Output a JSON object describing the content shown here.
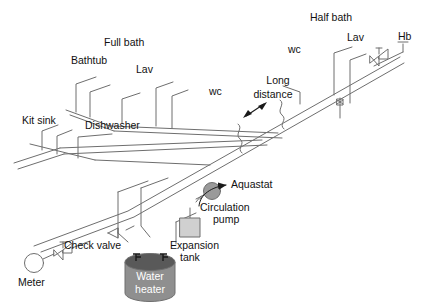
{
  "diagram": {
    "type": "piping-isometric",
    "colors": {
      "line": "#6e6e6e",
      "line_dark": "#3a3a3a",
      "text": "#111111",
      "pump_fill": "#9a9a9a",
      "heater_body": "#8f8f8f",
      "heater_top": "#595959",
      "tank_fill": "#d0d0d0",
      "background": "#ffffff"
    },
    "labels": {
      "full_bath": "Full bath",
      "bathtub": "Bathtub",
      "lav_left": "Lav",
      "kit_sink": "Kit sink",
      "dishwasher": "Dishwasher",
      "wc_left": "wc",
      "half_bath": "Half bath",
      "lav_right": "Lav",
      "wc_right": "wc",
      "hb": "Hb",
      "long_distance_line1": "Long",
      "long_distance_line2": "distance",
      "aquastat": "Aquastat",
      "circulation_pump_line1": "Circulation",
      "circulation_pump_line2": "pump",
      "expansion_tank_line1": "Expansion",
      "expansion_tank_line2": "tank",
      "check_valve": "Check valve",
      "meter": "Meter",
      "water_heater_line1": "Water",
      "water_heater_line2": "heater"
    },
    "components": [
      {
        "name": "meter",
        "label": "Meter",
        "symbol": "circle"
      },
      {
        "name": "gate-valve-meter",
        "label": "",
        "symbol": "gate-valve"
      },
      {
        "name": "check-valve",
        "label": "Check valve",
        "symbol": "check-valve"
      },
      {
        "name": "water-heater",
        "label": "Water heater",
        "symbol": "cylinder"
      },
      {
        "name": "expansion-tank",
        "label": "Expansion tank",
        "symbol": "square-tank"
      },
      {
        "name": "circulation-pump",
        "label": "Circulation pump",
        "symbol": "filled-circle"
      },
      {
        "name": "aquastat",
        "label": "Aquastat",
        "symbol": "leader-arrow"
      },
      {
        "name": "hose-bib",
        "label": "Hb",
        "symbol": "hose-bib"
      },
      {
        "name": "gate-valve-hb",
        "label": "",
        "symbol": "gate-valve"
      },
      {
        "name": "riser-valve",
        "label": "",
        "symbol": "small-valve"
      },
      {
        "name": "long-distance-dimension",
        "label": "Long distance",
        "symbol": "double-arrow"
      }
    ],
    "fixtures_left_group": [
      "Bathtub",
      "Lav",
      "wc",
      "Kit sink",
      "Dishwasher"
    ],
    "fixtures_right_group": [
      "Lav",
      "wc",
      "Hb"
    ]
  }
}
